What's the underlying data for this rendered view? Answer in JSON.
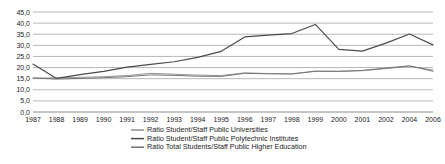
{
  "chart_data": {
    "type": "line",
    "title": "",
    "xlabel": "",
    "ylabel": "",
    "grid": true,
    "legend_position": "bottom",
    "ylim": [
      0,
      45
    ],
    "yticks": [
      "0,0",
      "5,0",
      "10,0",
      "15,0",
      "20,0",
      "25,0",
      "30,0",
      "35,0",
      "40,0",
      "45,0"
    ],
    "ytick_values": [
      0,
      5,
      10,
      15,
      20,
      25,
      30,
      35,
      40,
      45
    ],
    "categories": [
      "1987",
      "1988",
      "1989",
      "1990",
      "1991",
      "1992",
      "1993",
      "1994",
      "1995",
      "1996",
      "1997",
      "1998",
      "1999",
      "2000",
      "2001",
      "2002",
      "2004",
      "2006"
    ],
    "series": [
      {
        "name": "Ratio Student/Staff Public Universities",
        "color": "#8f8f8f",
        "values": [
          15.2,
          15.4,
          15.6,
          15.9,
          16.4,
          17.4,
          17.0,
          16.6,
          16.4,
          17.6,
          17.3,
          17.2,
          18.4,
          18.3,
          18.6,
          19.5,
          20.6,
          18.9
        ]
      },
      {
        "name": "Ratio Student/Staff Public Polytechnic Institutes",
        "color": "#4a4a4a",
        "values": [
          21.6,
          15.1,
          16.8,
          18.3,
          20.2,
          21.4,
          22.6,
          24.6,
          27.3,
          33.8,
          34.6,
          35.3,
          39.4,
          28.2,
          27.4,
          31.0,
          35.1,
          30.2
        ]
      },
      {
        "name": "Ratio Total Students/Staff Public Higher Education",
        "color": "#707070",
        "values": [
          15.3,
          14.8,
          15.1,
          15.4,
          15.9,
          16.7,
          16.5,
          16.1,
          16.0,
          17.4,
          17.2,
          17.1,
          18.3,
          18.3,
          18.7,
          19.8,
          20.8,
          18.3
        ]
      }
    ]
  }
}
